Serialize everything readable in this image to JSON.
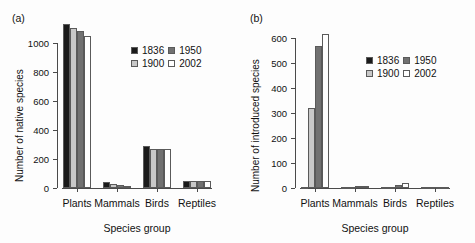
{
  "figure": {
    "background": "#fdfdfd",
    "panels": [
      "a",
      "b"
    ]
  },
  "panel_a": {
    "tag": "(a)",
    "ylabel": "Number of native species",
    "xlabel": "Species group",
    "yticks": [
      "0",
      "200",
      "400",
      "600",
      "800",
      "1000"
    ],
    "xticks": [
      "Plants",
      "Mammals",
      "Birds",
      "Reptiles"
    ],
    "legend": [
      {
        "label": "1836",
        "color": "#1a1a1a"
      },
      {
        "label": "1950",
        "color": "#717171"
      },
      {
        "label": "1900",
        "color": "#c8c8c8"
      },
      {
        "label": "2002",
        "color": "#ffffff"
      }
    ]
  },
  "panel_b": {
    "tag": "(b)",
    "ylabel": "Number of introduced species",
    "xlabel": "Species group",
    "yticks": [
      "0",
      "100",
      "200",
      "300",
      "400",
      "500",
      "600"
    ],
    "xticks": [
      "Plants",
      "Mammals",
      "Birds",
      "Reptiles"
    ],
    "legend": [
      {
        "label": "1836",
        "color": "#1a1a1a"
      },
      {
        "label": "1950",
        "color": "#717171"
      },
      {
        "label": "1900",
        "color": "#c8c8c8"
      },
      {
        "label": "2002",
        "color": "#ffffff"
      }
    ]
  },
  "chart_data": [
    {
      "type": "bar",
      "panel": "(a)",
      "title": "",
      "xlabel": "Species group",
      "ylabel": "Number of native species",
      "categories": [
        "Plants",
        "Mammals",
        "Birds",
        "Reptiles"
      ],
      "ylim": [
        0,
        1100
      ],
      "ytick_values": [
        0,
        200,
        400,
        600,
        800,
        1000
      ],
      "grid": false,
      "legend_position": "upper-right-inside",
      "series": [
        {
          "name": "1836",
          "color": "#1a1a1a",
          "values": [
            1130,
            38,
            292,
            50
          ]
        },
        {
          "name": "1900",
          "color": "#c8c8c8",
          "values": [
            1100,
            30,
            265,
            48
          ]
        },
        {
          "name": "1950",
          "color": "#717171",
          "values": [
            1080,
            22,
            268,
            48
          ]
        },
        {
          "name": "2002",
          "color": "#ffffff",
          "values": [
            1045,
            15,
            268,
            48
          ]
        }
      ]
    },
    {
      "type": "bar",
      "panel": "(b)",
      "title": "",
      "xlabel": "Species group",
      "ylabel": "Number of introduced species",
      "categories": [
        "Plants",
        "Mammals",
        "Birds",
        "Reptiles"
      ],
      "ylim": [
        0,
        640
      ],
      "ytick_values": [
        0,
        100,
        200,
        300,
        400,
        500,
        600
      ],
      "grid": false,
      "legend_position": "upper-right-inside",
      "series": [
        {
          "name": "1836",
          "color": "#1a1a1a",
          "values": [
            3,
            1,
            1,
            0
          ]
        },
        {
          "name": "1900",
          "color": "#c8c8c8",
          "values": [
            320,
            6,
            6,
            2
          ]
        },
        {
          "name": "1950",
          "color": "#717171",
          "values": [
            570,
            10,
            12,
            3
          ]
        },
        {
          "name": "2002",
          "color": "#ffffff",
          "values": [
            615,
            7,
            20,
            2
          ]
        }
      ]
    }
  ]
}
